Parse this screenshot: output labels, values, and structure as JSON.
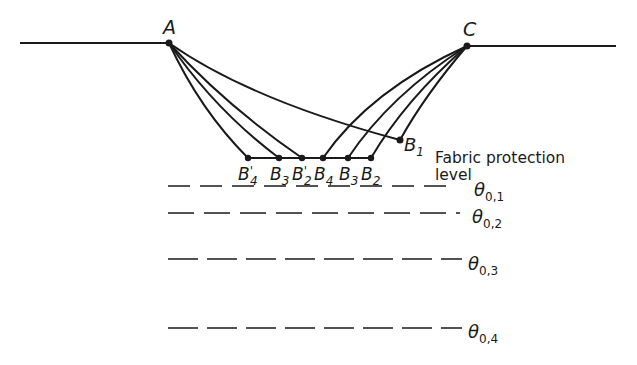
{
  "points": {
    "A": {
      "label": "A"
    },
    "C": {
      "label": "C"
    },
    "B1": {
      "label": "B",
      "sub": "1"
    },
    "B2p": {
      "label": "B",
      "prime": "'",
      "sub": "2"
    },
    "B3p": {
      "label": "B",
      "prime": "'",
      "sub": "3"
    },
    "B4p": {
      "label": "B",
      "prime": "'",
      "sub": "4"
    },
    "B2": {
      "label": "B",
      "sub": "2"
    },
    "B3": {
      "label": "B",
      "sub": "3"
    },
    "B4": {
      "label": "B",
      "sub": "4"
    }
  },
  "fabric_label": {
    "line1": "Fabric protection",
    "line2": "level"
  },
  "levels": [
    {
      "symbol": "θ",
      "sub": "0,1"
    },
    {
      "symbol": "θ",
      "sub": "0,2"
    },
    {
      "symbol": "θ",
      "sub": "0,3"
    },
    {
      "symbol": "θ",
      "sub": "0,4"
    }
  ],
  "colors": {
    "ink": "#1a1a1a",
    "background": "#ffffff"
  }
}
